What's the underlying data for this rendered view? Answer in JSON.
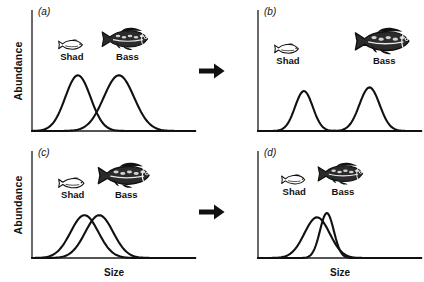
{
  "figure": {
    "axis_labels": {
      "y": "Abundance",
      "x": "Size"
    },
    "arrow_icon": "right-arrow-icon",
    "colors": {
      "ink": "#111111",
      "axis": "#1a1a1a",
      "curve": "#111111",
      "background": "#ffffff"
    }
  },
  "species": {
    "shad": {
      "label": "Shad",
      "icon": "shad-fish-icon"
    },
    "bass": {
      "label": "Bass",
      "icon": "bass-fish-icon"
    }
  },
  "panels": [
    {
      "id": "a",
      "label": "(a)",
      "show_ylabel": true,
      "show_xlabel": false,
      "fish": {
        "left_pct": 16,
        "top_pct": 22,
        "width_pct": 62,
        "gap_px": 16,
        "shad_scale": 0.8,
        "bass_scale": 1.0
      },
      "curves": [
        {
          "name": "shad-curve",
          "center_pct": 28,
          "width_pct": 20,
          "height_pct": 46
        },
        {
          "name": "bass-curve",
          "center_pct": 53,
          "width_pct": 24,
          "height_pct": 46
        }
      ]
    },
    {
      "id": "b",
      "label": "(b)",
      "show_ylabel": false,
      "show_xlabel": false,
      "fish": {
        "left_pct": 10,
        "top_pct": 22,
        "width_pct": 86,
        "gap_px": 52,
        "shad_scale": 0.8,
        "bass_scale": 1.18
      },
      "curves": [
        {
          "name": "shad-curve",
          "center_pct": 28,
          "width_pct": 14,
          "height_pct": 33
        },
        {
          "name": "bass-curve",
          "center_pct": 68,
          "width_pct": 16,
          "height_pct": 36
        }
      ]
    },
    {
      "id": "c",
      "label": "(c)",
      "show_ylabel": true,
      "show_xlabel": true,
      "fish": {
        "left_pct": 16,
        "top_pct": 20,
        "width_pct": 64,
        "gap_px": 10,
        "shad_scale": 0.85,
        "bass_scale": 1.12
      },
      "curves": [
        {
          "name": "shad-curve",
          "center_pct": 32,
          "width_pct": 22,
          "height_pct": 40
        },
        {
          "name": "bass-curve",
          "center_pct": 41,
          "width_pct": 22,
          "height_pct": 40
        }
      ]
    },
    {
      "id": "d",
      "label": "(d)",
      "show_ylabel": false,
      "show_xlabel": true,
      "fish": {
        "left_pct": 14,
        "top_pct": 20,
        "width_pct": 66,
        "gap_px": 10,
        "shad_scale": 0.78,
        "bass_scale": 0.98
      },
      "curves": [
        {
          "name": "shad-curve",
          "center_pct": 36,
          "width_pct": 20,
          "height_pct": 38
        },
        {
          "name": "bass-curve",
          "center_pct": 42,
          "width_pct": 11,
          "height_pct": 42
        }
      ]
    }
  ],
  "chart_data": {
    "type": "line",
    "title": "",
    "xlabel": "Size",
    "ylabel": "Abundance",
    "grid": false,
    "legend": "none",
    "panels": [
      {
        "panel": "a",
        "series": [
          {
            "name": "Shad",
            "peak_x_pct": 28,
            "sd_x_pct": 20,
            "peak_height_pct": 46
          },
          {
            "name": "Bass",
            "peak_x_pct": 53,
            "sd_x_pct": 24,
            "peak_height_pct": 46
          }
        ]
      },
      {
        "panel": "b",
        "series": [
          {
            "name": "Shad",
            "peak_x_pct": 28,
            "sd_x_pct": 14,
            "peak_height_pct": 33
          },
          {
            "name": "Bass",
            "peak_x_pct": 68,
            "sd_x_pct": 16,
            "peak_height_pct": 36
          }
        ]
      },
      {
        "panel": "c",
        "series": [
          {
            "name": "Shad",
            "peak_x_pct": 32,
            "sd_x_pct": 22,
            "peak_height_pct": 40
          },
          {
            "name": "Bass",
            "peak_x_pct": 41,
            "sd_x_pct": 22,
            "peak_height_pct": 40
          }
        ]
      },
      {
        "panel": "d",
        "series": [
          {
            "name": "Shad",
            "peak_x_pct": 36,
            "sd_x_pct": 20,
            "peak_height_pct": 38
          },
          {
            "name": "Bass",
            "peak_x_pct": 42,
            "sd_x_pct": 11,
            "peak_height_pct": 42
          }
        ]
      }
    ]
  }
}
